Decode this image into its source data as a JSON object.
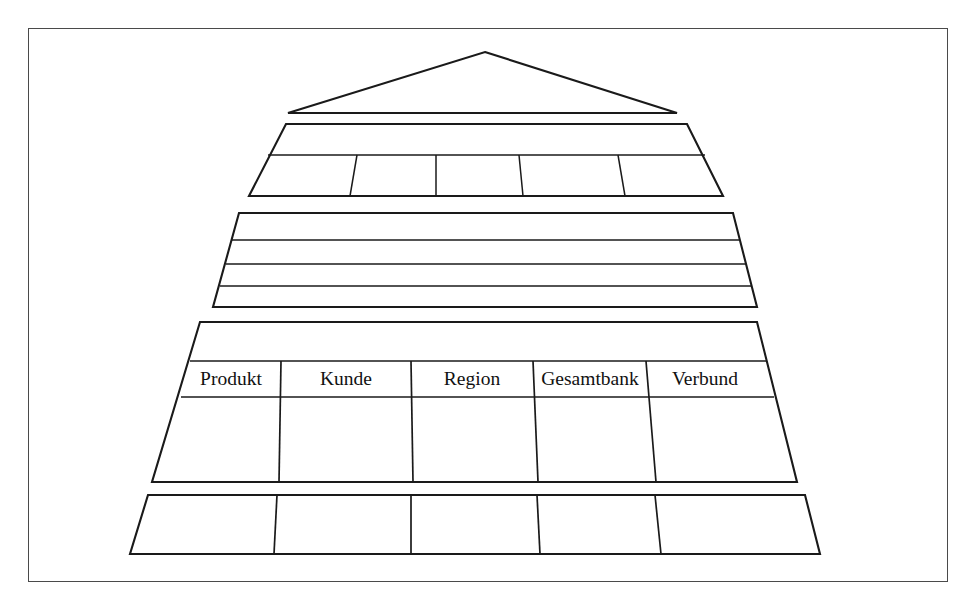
{
  "figure": {
    "type": "stepped-pyramid-diagram",
    "background_color": "#ffffff",
    "frame_color": "#4a4a4a",
    "line_color": "#1a1a1a",
    "highlight_color": "#e8e8e8"
  },
  "pyramid": {
    "levels": [
      {
        "name": "apex",
        "shape": "triangle",
        "rows": 1,
        "columns": 0,
        "labels": []
      },
      {
        "name": "level-2",
        "shape": "trapezoid",
        "rows": 2,
        "columns": 5,
        "labels": []
      },
      {
        "name": "level-3",
        "shape": "trapezoid",
        "rows": 4,
        "columns": 0,
        "labels": []
      },
      {
        "name": "level-4",
        "shape": "trapezoid",
        "rows": 3,
        "columns": 5,
        "labels": [
          "Produkt",
          "Kunde",
          "Region",
          "Gesamtbank",
          "Verbund"
        ]
      },
      {
        "name": "level-5",
        "shape": "trapezoid",
        "rows": 1,
        "columns": 5,
        "labels": []
      }
    ]
  },
  "labels": {
    "produkt": "Produkt",
    "kunde": "Kunde",
    "region": "Region",
    "gesamtbank": "Gesamtbank",
    "verbund": "Verbund"
  },
  "highlighted_cell": {
    "column_label": "Produkt",
    "level": "level-4",
    "fill": "#e8e8e8"
  }
}
